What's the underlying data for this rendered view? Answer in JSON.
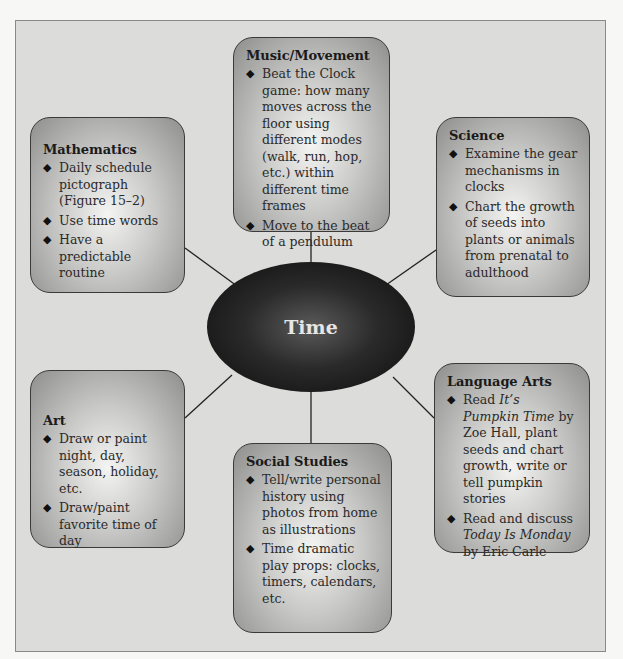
{
  "diagram": {
    "center": {
      "label": "Time"
    },
    "nodes": [
      {
        "id": "music",
        "title": "Music/Movement",
        "items": [
          "Beat the Clock game: how many moves across the floor using different modes (walk, run, hop, etc.) within different time frames",
          "Move to the beat of a pendulum"
        ]
      },
      {
        "id": "mathematics",
        "title": "Mathematics",
        "items": [
          "Daily schedule pictograph (Figure 15–2)",
          "Use time words",
          "Have a predictable routine"
        ]
      },
      {
        "id": "science",
        "title": "Science",
        "items": [
          "Examine the gear mechanisms in clocks",
          "Chart the growth of seeds into plants or animals from prenatal to adulthood"
        ]
      },
      {
        "id": "art",
        "title": "Art",
        "items": [
          "Draw or paint night, day, season, holiday, etc.",
          "Draw/paint favorite time of day"
        ]
      },
      {
        "id": "social",
        "title": "Social Studies",
        "items": [
          "Tell/write personal history using photos from home as illustrations",
          "Time dramatic play props: clocks, timers, calendars, etc."
        ]
      },
      {
        "id": "language",
        "title": "Language Arts",
        "items": [
          {
            "pre": "Read ",
            "italic": "It’s Pumpkin Time",
            "post": " by Zoe Hall, plant seeds and chart growth, write or tell pumpkin stories"
          },
          {
            "pre": "Read and discuss ",
            "italic": "Today Is Monday",
            "post": " by Eric Carle"
          }
        ]
      }
    ],
    "bullet_icon": "◆"
  }
}
